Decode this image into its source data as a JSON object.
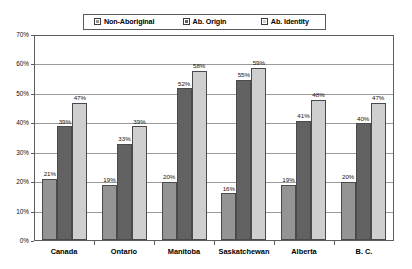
{
  "chart_data": {
    "type": "bar",
    "title": "",
    "subtitle": "",
    "xlabel": "",
    "ylabel": "",
    "ylim": [
      0,
      70
    ],
    "ytick_step": 10,
    "ytick_labels": [
      "0%",
      "10%",
      "20%",
      "30%",
      "40%",
      "50%",
      "60%",
      "70%"
    ],
    "grid": true,
    "legend_position": "top",
    "value_label_suffix": "%",
    "categories": [
      "Canada",
      "Ontario",
      "Manitoba",
      "Saskatchewan",
      "Alberta",
      "B. C."
    ],
    "series": [
      {
        "name": "Non-Aboriginal",
        "color": "#949494",
        "values": [
          21,
          19,
          20,
          16,
          19,
          20
        ],
        "labels": [
          "21%",
          "19%",
          "20%",
          "16%",
          "19%",
          "20%"
        ]
      },
      {
        "name": "Ab. Origin",
        "color": "#626262",
        "values": [
          39,
          33,
          52,
          55,
          41,
          40
        ],
        "labels": [
          "39%",
          "33%",
          "52%",
          "55%",
          "41%",
          "40%"
        ]
      },
      {
        "name": "Ab. Identity",
        "color": "#cfcfcf",
        "values": [
          47,
          39,
          58,
          59,
          48,
          47
        ],
        "labels": [
          "47%",
          "39%",
          "58%",
          "59%",
          "48%",
          "47%"
        ]
      }
    ]
  },
  "legend": {
    "items": [
      {
        "label": "Non-Aboriginal"
      },
      {
        "label": "Ab. Origin"
      },
      {
        "label": "Ab. Identity"
      }
    ]
  },
  "colors": {
    "series_1": "#949494",
    "series_2": "#626262",
    "series_3": "#cfcfcf",
    "grid": "#9a9a9a",
    "frame": "#5d5d5d",
    "background": "#ffffff"
  }
}
